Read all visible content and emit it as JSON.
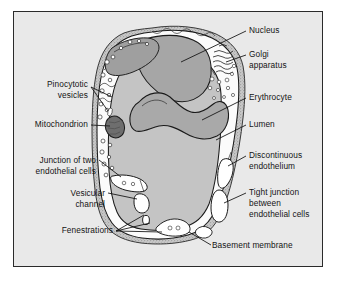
{
  "figure": {
    "background_color": "#e9e9e9",
    "frame_color": "#2b2b2b",
    "page_background": "#ffffff"
  },
  "palette": {
    "nucleus_fill": "#a6a6a6",
    "erythrocyte_fill": "#a9a9a9",
    "lumen_fill": "#c4c4c4",
    "cytoplasm_fill": "#fbfbfb",
    "mitochondrion_fill": "#6e6e6e",
    "basement_membrane_fill": "#bdbdbd",
    "outline": "#1a1a1a",
    "label_text": "#141414",
    "leader_line": "#0f0f0f"
  },
  "labels": {
    "right": [
      {
        "id": "nucleus",
        "lines": [
          "Nucleus"
        ],
        "x": 249,
        "y": 33
      },
      {
        "id": "golgi-apparatus",
        "lines": [
          "Golgi",
          "apparatus"
        ],
        "x": 249,
        "y": 57
      },
      {
        "id": "erythrocyte",
        "lines": [
          "Erythrocyte"
        ],
        "x": 249,
        "y": 100
      },
      {
        "id": "lumen",
        "lines": [
          "Lumen"
        ],
        "x": 249,
        "y": 127
      },
      {
        "id": "discontinuous-endothelium",
        "lines": [
          "Discontinuous",
          "endothelium"
        ],
        "x": 249,
        "y": 158
      },
      {
        "id": "tight-junction",
        "lines": [
          "Tight junction",
          "between",
          "endothelial cells"
        ],
        "x": 249,
        "y": 195
      }
    ],
    "bottom": [
      {
        "id": "basement-membrane",
        "lines": [
          "Basement membrane"
        ],
        "x": 212,
        "y": 248
      }
    ],
    "left": [
      {
        "id": "pinocytotic-vesicles",
        "lines": [
          "Pinocytotic",
          "vesicles"
        ],
        "x": 88,
        "y": 87
      },
      {
        "id": "mitochondrion",
        "lines": [
          "Mitochondrion"
        ],
        "x": 88,
        "y": 127
      },
      {
        "id": "junction-of-two-endothelial-cells",
        "lines": [
          "Junction of two",
          "endothelial cells"
        ],
        "x": 96,
        "y": 163
      },
      {
        "id": "vesicular-channel",
        "lines": [
          "Vesicular",
          "channel"
        ],
        "x": 105,
        "y": 196
      },
      {
        "id": "fenestrations",
        "lines": [
          "Fenestrations"
        ],
        "x": 113,
        "y": 233
      }
    ]
  },
  "structures": [
    {
      "id": "basement-membrane",
      "name": "Basement membrane",
      "description": "stippled outer layer enclosing the vessel"
    },
    {
      "id": "endothelial-cytoplasm",
      "name": "Endothelial cytoplasm",
      "description": "pale layer inside basement membrane"
    },
    {
      "id": "lumen",
      "name": "Lumen",
      "description": "central gray vessel space"
    },
    {
      "id": "nucleus",
      "name": "Nucleus",
      "description": "large gray mass in upper cell"
    },
    {
      "id": "golgi-apparatus",
      "name": "Golgi apparatus",
      "description": "stacked cisternae at upper right"
    },
    {
      "id": "erythrocyte",
      "name": "Erythrocyte",
      "description": "biconcave red blood cell within lumen"
    },
    {
      "id": "mitochondrion",
      "name": "Mitochondrion",
      "description": "dark oval organelle at left"
    },
    {
      "id": "pinocytotic-vesicles",
      "name": "Pinocytotic vesicles",
      "description": "small circles along cell membrane"
    },
    {
      "id": "fenestrations",
      "name": "Fenestrations",
      "description": "pore openings in thin endothelium"
    },
    {
      "id": "vesicular-channel",
      "name": "Vesicular channel",
      "description": "chain of vesicles spanning the cell"
    },
    {
      "id": "junction-of-two-endothelial-cells",
      "name": "Junction of two endothelial cells",
      "description": "interdigitating cell border at lower left"
    },
    {
      "id": "tight-junction",
      "name": "Tight junction between endothelial cells",
      "description": "sealed cell contact at lower right"
    },
    {
      "id": "discontinuous-endothelium",
      "name": "Discontinuous endothelium",
      "description": "gap in endothelial lining at right"
    }
  ]
}
